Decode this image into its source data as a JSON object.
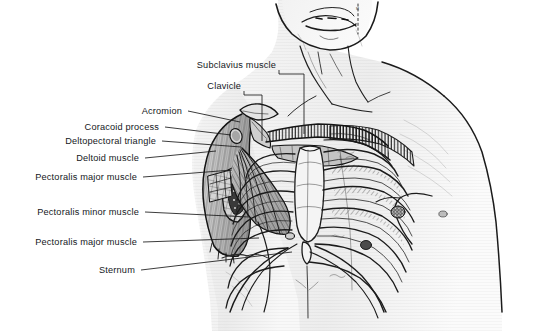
{
  "figure": {
    "type": "anatomical-illustration",
    "style": "grayscale pen-and-ink with wash shading",
    "background_color": "#ffffff",
    "ink_color": "#15181c",
    "view": "anterior view of neck, chest and shoulders; left side of body dissected to expose clavicle, subclavius, pectoralis major and minor, ribs and sternum"
  },
  "labels": [
    {
      "id": "subclavius-muscle",
      "text": "Subclavius muscle",
      "text_x": 276,
      "text_y": 65,
      "leader": [
        [
          279,
          70
        ],
        [
          279,
          75
        ],
        [
          304,
          75
        ],
        [
          304,
          134
        ]
      ]
    },
    {
      "id": "clavicle",
      "text": "Clavicle",
      "text_y": 86,
      "text_x": 241,
      "leader": [
        [
          244,
          91
        ],
        [
          244,
          96
        ],
        [
          262,
          96
        ],
        [
          262,
          142
        ]
      ]
    },
    {
      "id": "acromion",
      "text": "Acromion",
      "text_x": 182,
      "text_y": 111,
      "leader": [
        [
          188,
          111
        ],
        [
          240,
          122
        ]
      ]
    },
    {
      "id": "coracoid-process",
      "text": "Coracoid process",
      "text_x": 159,
      "text_y": 127,
      "leader": [
        [
          165,
          127
        ],
        [
          232,
          136
        ]
      ]
    },
    {
      "id": "deltopectoral-triangle",
      "text": "Deltopectoral triangle",
      "text_x": 156,
      "text_y": 140,
      "leader": [
        [
          162,
          140
        ],
        [
          240,
          147
        ]
      ]
    },
    {
      "id": "deltoid-muscle",
      "text": "Deltoid muscle",
      "text_x": 139,
      "text_y": 158,
      "leader": [
        [
          145,
          158
        ],
        [
          215,
          152
        ]
      ]
    },
    {
      "id": "pectoralis-major-muscle-upper",
      "text": "Pectoralis major muscle",
      "text_x": 137,
      "text_y": 177,
      "leader": [
        [
          143,
          177
        ],
        [
          232,
          170
        ]
      ]
    },
    {
      "id": "pectoralis-minor-muscle",
      "text": "Pectoralis minor muscle",
      "text_x": 139,
      "text_y": 212,
      "leader": [
        [
          145,
          212
        ],
        [
          248,
          217
        ]
      ]
    },
    {
      "id": "pectoralis-major-muscle-lower",
      "text": "Pectoralis major muscle",
      "text_x": 137,
      "text_y": 242,
      "leader": [
        [
          143,
          242
        ],
        [
          258,
          238
        ]
      ]
    },
    {
      "id": "sternum",
      "text": "Sternum",
      "text_x": 135,
      "text_y": 270,
      "leader": [
        [
          141,
          270
        ],
        [
          290,
          253
        ]
      ]
    }
  ],
  "structures": [
    "chin and jaw",
    "neck with sternocleidomastoid",
    "clavicle (left, cut and hatched)",
    "subclavius muscle",
    "acromion",
    "coracoid process",
    "deltopectoral triangle",
    "deltoid muscle",
    "pectoralis major muscle (cut)",
    "pectoralis minor muscle (fanned fibers)",
    "sternum with xiphoid process",
    "ribs 1–7 with intercostal muscles",
    "right shoulder and arm (intact skin)",
    "nipple"
  ]
}
